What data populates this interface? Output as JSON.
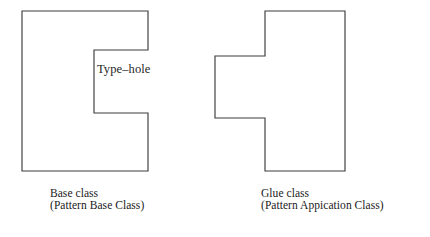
{
  "diagram": {
    "background_color": "#ffffff",
    "stroke_color": "#3c3c3c",
    "fill_color": "#ffffff"
  },
  "shapes": {
    "base_class": {
      "name": "base-class-shape",
      "description": "C-shaped rectangle with a rectangular notch cut from its right side",
      "points": "22,11 148,11 148,50 94,50 94,113 148,113 148,171 22,171",
      "annotation": "Type–hole"
    },
    "glue_class": {
      "name": "glue-class-shape",
      "description": "Rectangle with a rectangular tab protruding from its left side",
      "points": "265,11 345,11 345,171 265,171 265,118 215,118 215,56 265,56"
    }
  },
  "labels": {
    "type_hole": "Type–hole"
  },
  "captions": {
    "base_class": {
      "line1": "Base class",
      "line2": "(Pattern Base Class)"
    },
    "glue_class": {
      "line1": "Glue class",
      "line2": "(Pattern Appication Class)"
    }
  }
}
